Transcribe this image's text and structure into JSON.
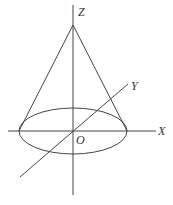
{
  "diagram": {
    "labels": {
      "z_axis": "Z",
      "y_axis": "Y",
      "x_axis": "X",
      "origin": "O"
    },
    "colors": {
      "stroke": "#444444",
      "text": "#333333",
      "background": "#ffffff"
    }
  }
}
